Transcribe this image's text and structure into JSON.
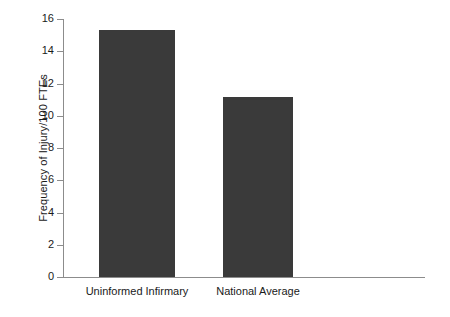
{
  "chart_data": {
    "type": "bar",
    "title": "",
    "xlabel": "",
    "ylabel": "Frequency of Injury/100 FTEs",
    "categories": [
      "Uninformed Infirmary",
      "National Average"
    ],
    "values": [
      15.3,
      11.15
    ],
    "ylim": [
      0,
      16
    ],
    "yticks": [
      0,
      2,
      4,
      6,
      8,
      10,
      12,
      14,
      16
    ],
    "ytick_labels": [
      "0",
      "2",
      "4",
      "6",
      "8",
      "10",
      "12",
      "14",
      "16"
    ],
    "grid": false,
    "legend": "none",
    "bar_color": "#3a3a3a",
    "axis_color": "#8c8c8c",
    "background_color": "#ffffff"
  },
  "axis": {
    "y_title": "Frequency of Injury/100 FTEs"
  },
  "ticks": [
    {
      "value": 16,
      "label": "16"
    },
    {
      "value": 14,
      "label": "14"
    },
    {
      "value": 12,
      "label": "12"
    },
    {
      "value": 10,
      "label": "10"
    },
    {
      "value": 8,
      "label": "8"
    },
    {
      "value": 6,
      "label": "6"
    },
    {
      "value": 4,
      "label": "4"
    },
    {
      "value": 2,
      "label": "2"
    },
    {
      "value": 0,
      "label": "0"
    }
  ],
  "bars": [
    {
      "label": "Uninformed Infirmary",
      "value": 15.3
    },
    {
      "label": "National Average",
      "value": 11.15
    }
  ]
}
